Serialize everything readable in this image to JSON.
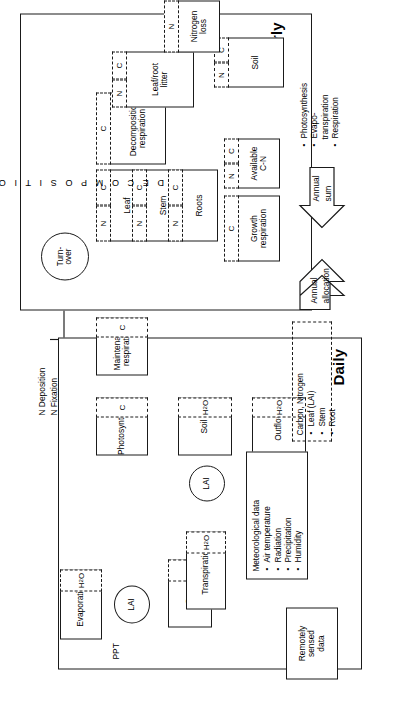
{
  "figure": {
    "orientation": "rotated-90-ccw"
  },
  "yearly": {
    "panel_label": "Yearly",
    "external_input": "N Deposition\nN Fixation",
    "external_input_line1": "N Deposition",
    "external_input_line2": "N Fixation",
    "turnover": "Turn-\nover",
    "turnover_line1": "Turn-",
    "turnover_line2": "over",
    "decomposition_label": "D E C O M P O S I T I O N",
    "boxes": [
      {
        "id": "leaf",
        "label": "Leaf",
        "cells": [
          "N",
          "C"
        ]
      },
      {
        "id": "stem",
        "label": "Stem",
        "cells": [
          "N",
          "C"
        ]
      },
      {
        "id": "roots",
        "label": "Roots",
        "cells": [
          "N",
          "C"
        ]
      },
      {
        "id": "growth_respiration",
        "label": "Growth\nrespiration",
        "label_line1": "Growth",
        "label_line2": "respiration",
        "cells": [
          "C"
        ]
      },
      {
        "id": "available_cn",
        "label": "Available\nC-N",
        "label_line1": "Available",
        "label_line2": "C-N",
        "cells": [
          "N",
          "C"
        ]
      },
      {
        "id": "decomposition_respiration",
        "label": "Decomposition\nrespiration",
        "label_line1": "Decomposition",
        "label_line2": "respiration",
        "cells": [
          "C"
        ]
      },
      {
        "id": "leaf_root_litter",
        "label": "Leaf/root\nlitter",
        "label_line1": "Leaf/root",
        "label_line2": "litter",
        "cells": [
          "N",
          "C"
        ]
      },
      {
        "id": "soil",
        "label": "Soil",
        "cells": [
          "N",
          "C"
        ]
      },
      {
        "id": "nitrogen_loss",
        "label": "Nitrogen\nloss",
        "label_line1": "Nitrogen",
        "label_line2": "loss",
        "cells": [
          "N"
        ]
      }
    ]
  },
  "daily": {
    "panel_label": "Daily",
    "ppt": "PPT",
    "lai": "LAI",
    "meteorological": {
      "heading": "Meteorological data",
      "items": [
        "Air temperature",
        "Radiation",
        "Precipitation",
        "Humidity"
      ]
    },
    "boxes": [
      {
        "id": "evaporation",
        "label": "Evaporation",
        "cells": [
          "H2O"
        ]
      },
      {
        "id": "snow",
        "label": "Snow",
        "cells": [
          "H2O"
        ]
      },
      {
        "id": "transpiration",
        "label": "Transpiration",
        "cells": [
          "H2O"
        ]
      },
      {
        "id": "photosynthesis",
        "label": "Photosynthesis",
        "cells": [
          "C"
        ]
      },
      {
        "id": "maintenance_respiration",
        "label": "Maintenance\nrespiration",
        "label_line1": "Maintenance",
        "label_line2": "respiration",
        "cells": [
          "C"
        ]
      },
      {
        "id": "soil_water",
        "label": "Soil",
        "cells": [
          "H2O"
        ]
      },
      {
        "id": "outflow",
        "label": "Outflow",
        "cells": [
          "H2O"
        ]
      }
    ]
  },
  "external": {
    "remotely_sensed": "Remotely\nsensed\ndata",
    "remotely_sensed_line1": "Remotely",
    "remotely_sensed_line2": "sensed",
    "remotely_sensed_line3": "data"
  },
  "couplings": {
    "carbon_nitrogen": {
      "heading": "Carbon, Nitrogen",
      "items": [
        "Leaf (LAI)",
        "Stem",
        "Root"
      ]
    },
    "annual_allocation": "Annual\nallocation",
    "annual_allocation_line1": "Annual",
    "annual_allocation_line2": "allocation",
    "annual_sum": "Annual\nsum",
    "annual_sum_line1": "Annual",
    "annual_sum_line2": "sum",
    "annual_sum_items": [
      "Photosynthesis",
      "Evapo-\ntranspiration",
      "Respiration"
    ],
    "annual_sum_item_1": "Photosynthesis",
    "annual_sum_item_2a": "Evapo-",
    "annual_sum_item_2b": "transpiration",
    "annual_sum_item_3": "Respiration"
  },
  "colors": {
    "ink": "#1a1a1a",
    "paper": "#ffffff"
  }
}
